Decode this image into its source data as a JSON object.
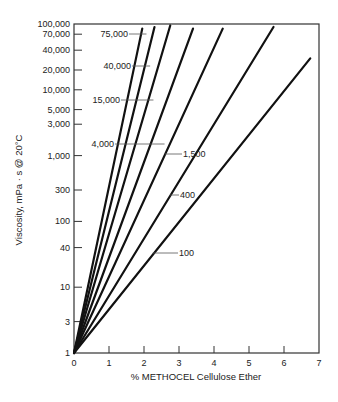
{
  "chart_data": {
    "type": "line",
    "title": "",
    "xlabel": "% METHOCEL Cellulose Ether",
    "ylabel": "Viscosity, mPa · s @ 20°C",
    "yscale": "log",
    "xlim": [
      0,
      7
    ],
    "ylim": [
      1,
      100000
    ],
    "grid": false,
    "x_ticks": [
      "0",
      "1",
      "2",
      "3",
      "4",
      "5",
      "6",
      "7"
    ],
    "y_ticks": [
      {
        "value": 100000,
        "label": "100,000"
      },
      {
        "value": 70000,
        "label": "70,000"
      },
      {
        "value": 40000,
        "label": "40,000"
      },
      {
        "value": 20000,
        "label": "20,000"
      },
      {
        "value": 10000,
        "label": "10,000"
      },
      {
        "value": 5000,
        "label": "5,000"
      },
      {
        "value": 3000,
        "label": "3,000"
      },
      {
        "value": 1000,
        "label": "1,000"
      },
      {
        "value": 300,
        "label": "300"
      },
      {
        "value": 100,
        "label": "100"
      },
      {
        "value": 40,
        "label": "40"
      },
      {
        "value": 10,
        "label": "10"
      },
      {
        "value": 3,
        "label": "3"
      },
      {
        "value": 1,
        "label": "1"
      }
    ],
    "series": [
      {
        "name": "75,000",
        "x": [
          0,
          1.95
        ],
        "y": [
          1,
          85000
        ]
      },
      {
        "name": "40,000",
        "x": [
          0,
          2.3
        ],
        "y": [
          1,
          90000
        ]
      },
      {
        "name": "15,000",
        "x": [
          0,
          2.75
        ],
        "y": [
          1,
          95000
        ]
      },
      {
        "name": "4,000",
        "x": [
          0,
          3.4
        ],
        "y": [
          1,
          85000
        ]
      },
      {
        "name": "1,500",
        "x": [
          0,
          4.25
        ],
        "y": [
          1,
          85000
        ]
      },
      {
        "name": "400",
        "x": [
          0,
          5.7
        ],
        "y": [
          1,
          90000
        ]
      },
      {
        "name": "100",
        "x": [
          0,
          6.75
        ],
        "y": [
          1,
          30000
        ]
      }
    ],
    "annotations": [
      {
        "text": "75,000",
        "series": "75,000"
      },
      {
        "text": "40,000",
        "series": "40,000"
      },
      {
        "text": "15,000",
        "series": "15,000"
      },
      {
        "text": "4,000",
        "series": "4,000"
      },
      {
        "text": "1,500",
        "series": "1,500"
      },
      {
        "text": "400",
        "series": "400"
      },
      {
        "text": "100",
        "series": "100"
      }
    ]
  }
}
